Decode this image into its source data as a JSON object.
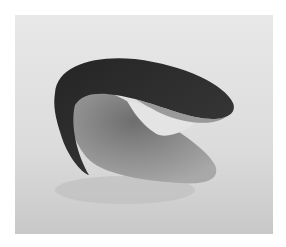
{
  "image": {
    "subject": "curved abstract sculpture",
    "style": "grayscale photograph",
    "colors": {
      "background_light": "#e6e6e6",
      "background_mid": "#cfcfcf",
      "sculpture_dark": "#2e2e2e",
      "sculpture_light": "#9a9a9a",
      "margin": "#ffffff"
    }
  }
}
